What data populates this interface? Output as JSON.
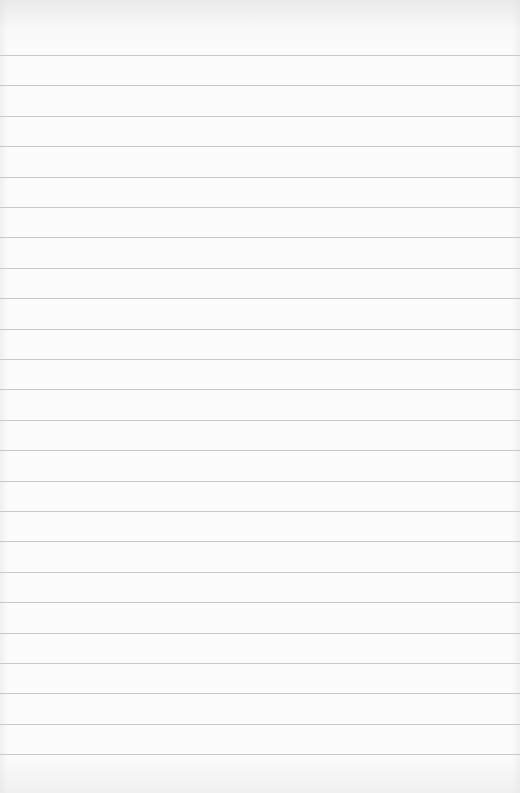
{
  "paper": {
    "type": "lined-paper",
    "background_color": "#fbfbfb",
    "line_color": "#c9c9c9",
    "first_line_y": 55,
    "line_spacing": 30.4,
    "line_count": 24
  }
}
